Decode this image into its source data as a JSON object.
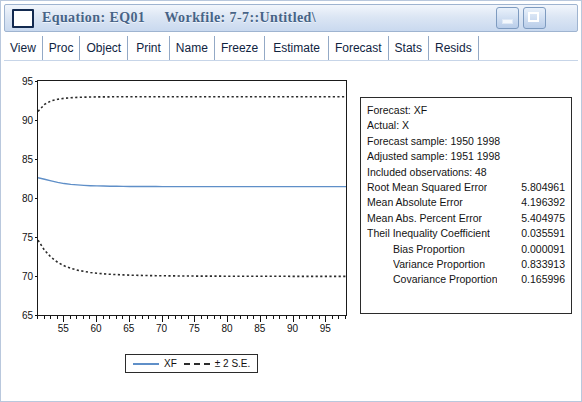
{
  "window": {
    "title": "Equation: EQ01     Workfile: 7-7::Untitled\\",
    "sys_icon": "window-icon",
    "minimize_label": "",
    "maximize_label": ""
  },
  "toolbar": {
    "buttons": [
      {
        "label": "View"
      },
      {
        "label": "Proc"
      },
      {
        "label": "Object"
      },
      {
        "label": "Print"
      },
      {
        "label": "Name"
      },
      {
        "label": "Freeze"
      },
      {
        "label": "Estimate"
      },
      {
        "label": "Forecast"
      },
      {
        "label": "Stats"
      },
      {
        "label": "Resids"
      }
    ]
  },
  "stats": {
    "rows": [
      {
        "label": "Forecast: XF",
        "value": "",
        "indent": false
      },
      {
        "label": "Actual: X",
        "value": "",
        "indent": false
      },
      {
        "label": "Forecast sample: 1950 1998",
        "value": "",
        "indent": false
      },
      {
        "label": "Adjusted sample: 1951 1998",
        "value": "",
        "indent": false
      },
      {
        "label": "Included observations: 48",
        "value": "",
        "indent": false
      },
      {
        "label": "Root Mean Squared Error",
        "value": "5.804961",
        "indent": false
      },
      {
        "label": "Mean Absolute Error",
        "value": "4.196392",
        "indent": false
      },
      {
        "label": "Mean Abs. Percent Error",
        "value": "5.404975",
        "indent": false
      },
      {
        "label": "Theil Inequality Coefficient",
        "value": "0.035591",
        "indent": false
      },
      {
        "label": "Bias Proportion",
        "value": "0.000091",
        "indent": true
      },
      {
        "label": "Variance Proportion",
        "value": "0.833913",
        "indent": true
      },
      {
        "label": "Covariance Proportion",
        "value": "0.165996",
        "indent": true
      }
    ]
  },
  "legend": {
    "forecast_label": "XF",
    "band_label": "± 2 S.E.",
    "forecast_color": "#5f8fc8",
    "band_color": "#2b2b2b"
  },
  "chart_data": {
    "type": "line",
    "title": "",
    "xlabel": "",
    "ylabel": "",
    "xlim": [
      51,
      98
    ],
    "ylim": [
      65,
      95
    ],
    "grid": false,
    "legend_position": "bottom-center",
    "yticks": [
      65,
      70,
      75,
      80,
      85,
      90,
      95
    ],
    "xticks": [
      55,
      60,
      65,
      70,
      75,
      80,
      85,
      90,
      95
    ],
    "x": [
      51,
      52,
      53,
      54,
      55,
      56,
      57,
      58,
      59,
      60,
      61,
      62,
      63,
      64,
      65,
      66,
      67,
      68,
      69,
      70,
      71,
      72,
      73,
      74,
      75,
      76,
      77,
      78,
      79,
      80,
      81,
      82,
      83,
      84,
      85,
      86,
      87,
      88,
      89,
      90,
      91,
      92,
      93,
      94,
      95,
      96,
      97,
      98
    ],
    "series": [
      {
        "name": "XF",
        "style": "solid",
        "color": "#5f8fc8",
        "values": [
          82.6,
          82.4,
          82.2,
          82.0,
          81.85,
          81.75,
          81.68,
          81.62,
          81.58,
          81.55,
          81.53,
          81.51,
          81.5,
          81.49,
          81.48,
          81.48,
          81.47,
          81.47,
          81.47,
          81.46,
          81.46,
          81.46,
          81.46,
          81.46,
          81.46,
          81.46,
          81.46,
          81.46,
          81.46,
          81.46,
          81.46,
          81.46,
          81.46,
          81.46,
          81.46,
          81.46,
          81.46,
          81.46,
          81.46,
          81.46,
          81.46,
          81.46,
          81.46,
          81.46,
          81.46,
          81.46,
          81.46,
          81.46
        ]
      },
      {
        "name": "+2 S.E.",
        "style": "dashed",
        "color": "#2b2b2b",
        "values": [
          91.1,
          92.0,
          92.45,
          92.65,
          92.78,
          92.85,
          92.9,
          92.93,
          92.95,
          92.96,
          92.97,
          92.97,
          92.98,
          92.98,
          92.98,
          92.98,
          92.98,
          92.98,
          92.98,
          92.98,
          92.98,
          92.98,
          92.98,
          92.98,
          92.98,
          92.98,
          92.98,
          92.98,
          92.98,
          92.98,
          92.98,
          92.98,
          92.98,
          92.98,
          92.98,
          92.98,
          92.98,
          92.98,
          92.98,
          92.98,
          92.98,
          92.98,
          92.98,
          92.98,
          92.98,
          92.98,
          92.98,
          92.98
        ]
      },
      {
        "name": "-2 S.E.",
        "style": "dashed",
        "color": "#2b2b2b",
        "values": [
          74.6,
          73.3,
          72.4,
          71.75,
          71.3,
          71.0,
          70.75,
          70.6,
          70.45,
          70.35,
          70.28,
          70.22,
          70.18,
          70.14,
          70.11,
          70.09,
          70.07,
          70.05,
          70.04,
          70.03,
          70.02,
          70.01,
          70.0,
          70.0,
          69.99,
          69.99,
          69.98,
          69.98,
          69.98,
          69.97,
          69.97,
          69.97,
          69.97,
          69.96,
          69.96,
          69.96,
          69.96,
          69.96,
          69.96,
          69.95,
          69.95,
          69.95,
          69.95,
          69.95,
          69.95,
          69.95,
          69.95,
          69.95
        ]
      }
    ]
  }
}
